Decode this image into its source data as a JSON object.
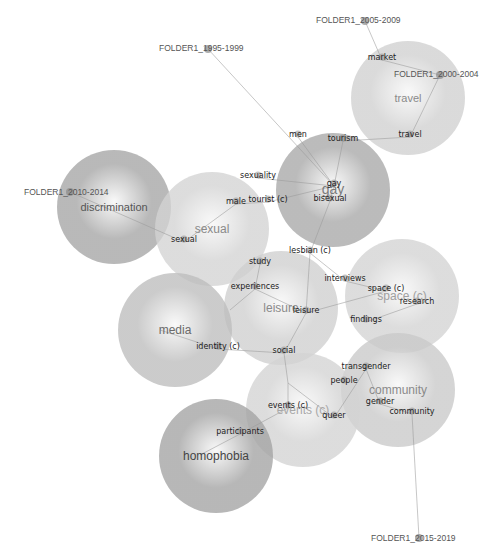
{
  "diagram": {
    "type": "concept-map",
    "themes": [
      {
        "id": "travel",
        "label": "travel",
        "cx": 408,
        "cy": 98,
        "r": 57,
        "shade": "#d0d0d0",
        "labelColor": "#8a8a8a",
        "fontSize": 11
      },
      {
        "id": "gay",
        "label": "gay",
        "cx": 333,
        "cy": 190,
        "r": 57,
        "shade": "#a8a8a8",
        "labelColor": "#7a7a7a",
        "fontSize": 14
      },
      {
        "id": "discrimination",
        "label": "discrimination",
        "cx": 114,
        "cy": 207,
        "r": 57,
        "shade": "#a5a5a5",
        "labelColor": "#555",
        "fontSize": 11
      },
      {
        "id": "sexual",
        "label": "sexual",
        "cx": 212,
        "cy": 229,
        "r": 57,
        "shade": "#d3d3d3",
        "labelColor": "#8a8a8a",
        "fontSize": 12
      },
      {
        "id": "space",
        "label": "space (c)",
        "cx": 402,
        "cy": 296,
        "r": 57,
        "shade": "#d3d3d3",
        "labelColor": "#a0a0a0",
        "fontSize": 12
      },
      {
        "id": "leisure",
        "label": "leisure",
        "cx": 281,
        "cy": 308,
        "r": 57,
        "shade": "#cfcfcf",
        "labelColor": "#8a8a8a",
        "fontSize": 12
      },
      {
        "id": "media",
        "label": "media",
        "cx": 175,
        "cy": 330,
        "r": 57,
        "shade": "#bdbdbd",
        "labelColor": "#6a6a6a",
        "fontSize": 12
      },
      {
        "id": "community",
        "label": "community",
        "cx": 398,
        "cy": 390,
        "r": 57,
        "shade": "#c9c9c9",
        "labelColor": "#8a8a8a",
        "fontSize": 12
      },
      {
        "id": "events",
        "label": "events (c)",
        "cx": 303,
        "cy": 410,
        "r": 57,
        "shade": "#d3d3d3",
        "labelColor": "#a8a8a8",
        "fontSize": 12
      },
      {
        "id": "homophobia",
        "label": "homophobia",
        "cx": 216,
        "cy": 456,
        "r": 57,
        "shade": "#a3a3a3",
        "labelColor": "#444",
        "fontSize": 12
      }
    ],
    "terms": [
      {
        "label": "market",
        "x": 382,
        "y": 60
      },
      {
        "label": "travel",
        "x": 410,
        "y": 137
      },
      {
        "label": "tourism",
        "x": 343,
        "y": 141
      },
      {
        "label": "men",
        "x": 298,
        "y": 137
      },
      {
        "label": "sexuality",
        "x": 258,
        "y": 178
      },
      {
        "label": "tourist (c)",
        "x": 268,
        "y": 202
      },
      {
        "label": "gay",
        "x": 334,
        "y": 186
      },
      {
        "label": "bisexual",
        "x": 330,
        "y": 201
      },
      {
        "label": "male",
        "x": 236,
        "y": 204
      },
      {
        "label": "sexual",
        "x": 184,
        "y": 242
      },
      {
        "label": "lesbian (c)",
        "x": 310,
        "y": 253
      },
      {
        "label": "study",
        "x": 260,
        "y": 264
      },
      {
        "label": "experiences",
        "x": 255,
        "y": 289
      },
      {
        "label": "interviews",
        "x": 345,
        "y": 281
      },
      {
        "label": "space (c)",
        "x": 386,
        "y": 291
      },
      {
        "label": "research",
        "x": 417,
        "y": 304
      },
      {
        "label": "leisure",
        "x": 306,
        "y": 313
      },
      {
        "label": "findings",
        "x": 366,
        "y": 322
      },
      {
        "label": "identity (c)",
        "x": 218,
        "y": 349
      },
      {
        "label": "social",
        "x": 284,
        "y": 353
      },
      {
        "label": "transgender",
        "x": 366,
        "y": 369
      },
      {
        "label": "people",
        "x": 344,
        "y": 383
      },
      {
        "label": "gender",
        "x": 380,
        "y": 404
      },
      {
        "label": "events (c)",
        "x": 288,
        "y": 408
      },
      {
        "label": "queer",
        "x": 334,
        "y": 418
      },
      {
        "label": "community",
        "x": 412,
        "y": 414
      },
      {
        "label": "participants",
        "x": 240,
        "y": 434
      }
    ],
    "folders": [
      {
        "label": "FOLDER1_2005-2009",
        "x": 316,
        "y": 23,
        "dotX": 365,
        "dotY": 21
      },
      {
        "label": "FOLDER1_1995-1999",
        "x": 159,
        "y": 51,
        "dotX": 208,
        "dotY": 49
      },
      {
        "label": "FOLDER1_2000-4004",
        "display": "FOLDER1_2000-2004",
        "x": 394,
        "y": 77,
        "dotX": 440,
        "dotY": 75
      },
      {
        "label": "FOLDER1_2010-2014",
        "display": "FOLDER1_2010-2014",
        "x": 24,
        "y": 195,
        "dotX": 70,
        "dotY": 192
      },
      {
        "label": "FOLDER1_2015-2019",
        "display": "FOLDER1_2015-2019",
        "x": 371,
        "y": 541,
        "dotX": 419,
        "dotY": 538
      }
    ],
    "edges": [
      [
        365,
        21,
        382,
        60
      ],
      [
        382,
        60,
        440,
        75
      ],
      [
        440,
        75,
        410,
        137
      ],
      [
        410,
        137,
        343,
        141
      ],
      [
        208,
        49,
        334,
        186
      ],
      [
        343,
        141,
        334,
        186
      ],
      [
        298,
        137,
        334,
        186
      ],
      [
        258,
        178,
        334,
        186
      ],
      [
        268,
        202,
        334,
        186
      ],
      [
        236,
        204,
        268,
        202
      ],
      [
        236,
        204,
        184,
        242
      ],
      [
        70,
        192,
        184,
        242
      ],
      [
        334,
        186,
        330,
        201
      ],
      [
        330,
        201,
        310,
        253
      ],
      [
        310,
        253,
        306,
        313
      ],
      [
        310,
        253,
        345,
        281
      ],
      [
        345,
        281,
        386,
        291
      ],
      [
        306,
        313,
        386,
        291
      ],
      [
        417,
        304,
        366,
        322
      ],
      [
        255,
        289,
        306,
        313
      ],
      [
        260,
        264,
        255,
        289
      ],
      [
        255,
        289,
        230,
        310
      ],
      [
        306,
        313,
        284,
        353
      ],
      [
        218,
        349,
        284,
        353
      ],
      [
        160,
        330,
        218,
        349
      ],
      [
        284,
        353,
        288,
        383
      ],
      [
        288,
        383,
        288,
        408
      ],
      [
        288,
        383,
        334,
        418
      ],
      [
        334,
        418,
        366,
        369
      ],
      [
        366,
        369,
        380,
        404
      ],
      [
        380,
        404,
        412,
        414
      ],
      [
        240,
        434,
        288,
        408
      ],
      [
        200,
        455,
        240,
        434
      ],
      [
        412,
        414,
        419,
        538
      ]
    ]
  }
}
